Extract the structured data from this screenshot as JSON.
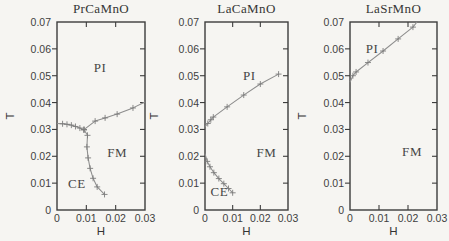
{
  "figure": {
    "xlabel": "H",
    "ylabel": "T",
    "x_ticks": [
      "0",
      "0.01",
      "0.02",
      "0.03"
    ],
    "y_ticks": [
      "0",
      "0.01",
      "0.02",
      "0.03",
      "0.04",
      "0.05",
      "0.06",
      "0.07"
    ],
    "colors": {
      "background": "#f6f5f2",
      "frame": "#3d3d3d",
      "curve": "#8d8d8d",
      "marker": "#7d7d7d",
      "text": "#3b3b3b"
    }
  },
  "chart_data": [
    {
      "type": "line",
      "title": "PrCaMnO",
      "xlabel": "H",
      "ylabel": "T",
      "xlim": [
        0,
        0.03
      ],
      "ylim": [
        0,
        0.07
      ],
      "x_tick_values": [
        0,
        0.01,
        0.02,
        0.03
      ],
      "y_tick_values": [
        0,
        0.01,
        0.02,
        0.03,
        0.04,
        0.05,
        0.06,
        0.07
      ],
      "regions": [
        {
          "label": "PI",
          "x": 0.0147,
          "y": 0.053
        },
        {
          "label": "FM",
          "x": 0.0205,
          "y": 0.0212
        },
        {
          "label": "CE",
          "x": 0.0068,
          "y": 0.0098
        }
      ],
      "series": [
        {
          "name": "CO-PI boundary",
          "marker": "+",
          "points": [
            [
              0,
              0.0322
            ],
            [
              0.0019,
              0.0321
            ],
            [
              0.0034,
              0.0319
            ],
            [
              0.0049,
              0.0316
            ],
            [
              0.0063,
              0.0311
            ],
            [
              0.0078,
              0.0305
            ],
            [
              0.0092,
              0.0299
            ]
          ]
        },
        {
          "name": "PI-FM boundary",
          "marker": "+",
          "points": [
            [
              0.0092,
              0.0299
            ],
            [
              0.013,
              0.0331
            ],
            [
              0.0164,
              0.0343
            ],
            [
              0.0205,
              0.0357
            ],
            [
              0.0259,
              0.038
            ],
            [
              0.03,
              0.0402
            ]
          ]
        },
        {
          "name": "CE-FM boundary",
          "marker": "+",
          "points": [
            [
              0.0092,
              0.0299
            ],
            [
              0.0104,
              0.0278
            ],
            [
              0.0102,
              0.0235
            ],
            [
              0.0106,
              0.0194
            ],
            [
              0.0113,
              0.0155
            ],
            [
              0.0123,
              0.0118
            ],
            [
              0.0137,
              0.0086
            ],
            [
              0.0162,
              0.0058
            ]
          ]
        }
      ]
    },
    {
      "type": "line",
      "title": "LaCaMnO",
      "xlabel": "H",
      "ylabel": "T",
      "xlim": [
        0,
        0.03
      ],
      "ylim": [
        0,
        0.07
      ],
      "x_tick_values": [
        0,
        0.01,
        0.02,
        0.03
      ],
      "y_tick_values": [
        0,
        0.01,
        0.02,
        0.03,
        0.04,
        0.05,
        0.06,
        0.07
      ],
      "regions": [
        {
          "label": "PI",
          "x": 0.016,
          "y": 0.0498
        },
        {
          "label": "FM",
          "x": 0.0222,
          "y": 0.0212
        },
        {
          "label": "CE",
          "x": 0.0052,
          "y": 0.0068
        }
      ],
      "series": [
        {
          "name": "PI-FM boundary",
          "marker": "+",
          "points": [
            [
              0,
              0.031
            ],
            [
              0.001,
              0.0322
            ],
            [
              0.0021,
              0.0336
            ],
            [
              0.003,
              0.0346
            ],
            [
              0.008,
              0.0384
            ],
            [
              0.014,
              0.0428
            ],
            [
              0.02,
              0.0469
            ],
            [
              0.0266,
              0.0506
            ]
          ]
        },
        {
          "name": "CE-FM boundary",
          "marker": "+",
          "points": [
            [
              0,
              0.021
            ],
            [
              0.0008,
              0.0181
            ],
            [
              0.0018,
              0.0161
            ],
            [
              0.0032,
              0.0139
            ],
            [
              0.005,
              0.0117
            ],
            [
              0.0068,
              0.0098
            ],
            [
              0.0085,
              0.008
            ],
            [
              0.01,
              0.0064
            ]
          ]
        }
      ]
    },
    {
      "type": "line",
      "title": "LaSrMnO",
      "xlabel": "H",
      "ylabel": "T",
      "xlim": [
        0,
        0.03
      ],
      "ylim": [
        0,
        0.07
      ],
      "x_tick_values": [
        0,
        0.01,
        0.02,
        0.03
      ],
      "y_tick_values": [
        0,
        0.01,
        0.02,
        0.03,
        0.04,
        0.05,
        0.06,
        0.07
      ],
      "regions": [
        {
          "label": "PI",
          "x": 0.0076,
          "y": 0.06
        },
        {
          "label": "FM",
          "x": 0.0214,
          "y": 0.0215
        }
      ],
      "series": [
        {
          "name": "PI-FM boundary",
          "marker": "+",
          "points": [
            [
              0,
              0.0476
            ],
            [
              0.001,
              0.05
            ],
            [
              0.0021,
              0.0514
            ],
            [
              0.0062,
              0.0549
            ],
            [
              0.0114,
              0.0592
            ],
            [
              0.0166,
              0.0637
            ],
            [
              0.0217,
              0.0681
            ],
            [
              0.0231,
              0.07
            ]
          ]
        }
      ]
    }
  ]
}
